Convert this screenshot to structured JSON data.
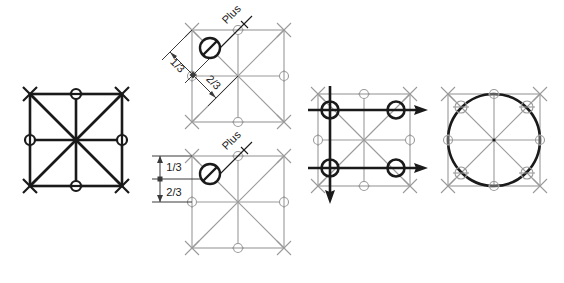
{
  "canvas": {
    "width": 564,
    "height": 283,
    "background": "#ffffff"
  },
  "style": {
    "bold_stroke_color": "#1a1a1a",
    "grid_stroke_color": "#9a9a9a",
    "node_marker_color": "#9a9a9a",
    "dimension_color": "#3a3a3a",
    "bold_stroke_width": "3",
    "grid_stroke_width": "1",
    "label_font_size": "11"
  },
  "figures": [
    {
      "id": "fig-1-bold-grid",
      "name": "bold-square-grid-diagram",
      "caption": "",
      "elements": {
        "square": "bold outline square",
        "diagonals": "two full diagonals",
        "midlines": "vertical and horizontal center lines",
        "corner_marks": "x cross marks at 4 corners",
        "node_markers": "circled nodes at 4 edge midpoints"
      }
    },
    {
      "id": "fig-2-plus-diagonal",
      "name": "plus-node-diagonal-dimension-diagram",
      "labels": {
        "plus": "Plus",
        "dim_upper": "1/3",
        "dim_lower": "2/3"
      },
      "dimension_orientation": "diagonal",
      "symbol": "circle-with-slash"
    },
    {
      "id": "fig-3-plus-vertical",
      "name": "plus-node-vertical-dimension-diagram",
      "labels": {
        "plus": "Plus",
        "dim_upper": "1/3",
        "dim_lower": "2/3"
      },
      "dimension_orientation": "vertical",
      "symbol": "circle-with-slash"
    },
    {
      "id": "fig-4-arrows",
      "name": "arrow-vector-grid-diagram",
      "elements": {
        "horizontal_arrows": 2,
        "vertical_arrows": 1,
        "bold_node_circles": 4
      }
    },
    {
      "id": "fig-5-circle",
      "name": "inscribed-circle-grid-diagram",
      "elements": {
        "circle": "bold inscribed circle",
        "node_markers": 8
      }
    }
  ]
}
